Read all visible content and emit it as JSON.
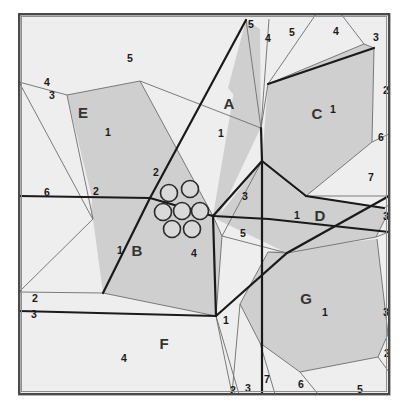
{
  "figure": {
    "name": "power-diagram-partition",
    "background_color": "#ffffff",
    "frame": {
      "x": 18,
      "y": 13,
      "width": 372,
      "height": 382,
      "outer_stroke": "#4a4a4a",
      "inner_stroke": "#8f8f8f"
    },
    "colors": {
      "shaded_cell": "#cfcfcf",
      "light_cell": "#eeeeee",
      "thin_edge": "#6d6d6d",
      "thick_edge": "#1a1a1a",
      "node_fill": "#d9d9d9",
      "node_stroke": "#2a2a2a",
      "label_text": "#1a1a1a"
    }
  },
  "region_labels": [
    {
      "text": "E",
      "x": 83,
      "y": 114
    },
    {
      "text": "A",
      "x": 229,
      "y": 105
    },
    {
      "text": "C",
      "x": 317,
      "y": 115
    },
    {
      "text": "B",
      "x": 137,
      "y": 252
    },
    {
      "text": "D",
      "x": 320,
      "y": 217
    },
    {
      "text": "G",
      "x": 306,
      "y": 300
    },
    {
      "text": "F",
      "x": 164,
      "y": 345
    }
  ],
  "number_labels": [
    {
      "text": "5",
      "x": 130,
      "y": 59
    },
    {
      "text": "4",
      "x": 47,
      "y": 83
    },
    {
      "text": "3",
      "x": 52,
      "y": 96
    },
    {
      "text": "1",
      "x": 108,
      "y": 133
    },
    {
      "text": "5",
      "x": 251,
      "y": 25
    },
    {
      "text": "4",
      "x": 268,
      "y": 39
    },
    {
      "text": "5",
      "x": 292,
      "y": 33
    },
    {
      "text": "4",
      "x": 336,
      "y": 32
    },
    {
      "text": "3",
      "x": 376,
      "y": 38
    },
    {
      "text": "1",
      "x": 333,
      "y": 110
    },
    {
      "text": "2",
      "x": 386,
      "y": 91
    },
    {
      "text": "6",
      "x": 381,
      "y": 138
    },
    {
      "text": "1",
      "x": 221,
      "y": 134
    },
    {
      "text": "2",
      "x": 156,
      "y": 173
    },
    {
      "text": "6",
      "x": 47,
      "y": 193
    },
    {
      "text": "2",
      "x": 96,
      "y": 192
    },
    {
      "text": "3",
      "x": 245,
      "y": 197
    },
    {
      "text": "7",
      "x": 371,
      "y": 178
    },
    {
      "text": "1",
      "x": 297,
      "y": 216
    },
    {
      "text": "3",
      "x": 386,
      "y": 217
    },
    {
      "text": "5",
      "x": 243,
      "y": 234
    },
    {
      "text": "1",
      "x": 120,
      "y": 251
    },
    {
      "text": "4",
      "x": 194,
      "y": 254
    },
    {
      "text": "2",
      "x": 35,
      "y": 299
    },
    {
      "text": "3",
      "x": 34,
      "y": 315
    },
    {
      "text": "1",
      "x": 325,
      "y": 313
    },
    {
      "text": "3",
      "x": 386,
      "y": 313
    },
    {
      "text": "1",
      "x": 226,
      "y": 321
    },
    {
      "text": "2",
      "x": 387,
      "y": 354
    },
    {
      "text": "4",
      "x": 124,
      "y": 359
    },
    {
      "text": "7",
      "x": 267,
      "y": 380
    },
    {
      "text": "6",
      "x": 301,
      "y": 385
    },
    {
      "text": "5",
      "x": 360,
      "y": 390
    },
    {
      "text": "2",
      "x": 233,
      "y": 391
    },
    {
      "text": "3",
      "x": 248,
      "y": 389
    }
  ],
  "nodes": [
    {
      "name": "node-top-left",
      "cx": 169,
      "cy": 193,
      "r": 8.5
    },
    {
      "name": "node-top-right",
      "cx": 190,
      "cy": 189,
      "r": 8.5
    },
    {
      "name": "node-left",
      "cx": 163,
      "cy": 212,
      "r": 8.5
    },
    {
      "name": "node-center",
      "cx": 182,
      "cy": 211,
      "r": 8.5
    },
    {
      "name": "node-right",
      "cx": 200,
      "cy": 211,
      "r": 8.5
    },
    {
      "name": "node-bottom-left",
      "cx": 172,
      "cy": 229,
      "r": 8.5
    },
    {
      "name": "node-bottom-right",
      "cx": 192,
      "cy": 229,
      "r": 8.5
    }
  ],
  "shaded_cells": [
    {
      "name": "cell-E",
      "points": "67,95 140,81 213,216 145,291 91,216 92,198"
    },
    {
      "name": "cell-A",
      "points": "246,20 260,29 261,127 219,216 150,198 150,196 213,216"
    },
    {
      "name": "cell-C",
      "points": "268,84 364,44 374,48 372,142 306,196 262,160"
    },
    {
      "name": "cell-B",
      "points": "148,198 213,216 222,236 216,316 103,293 93,219"
    },
    {
      "name": "cell-D",
      "points": "262,161 303,196 384,208 388,213 376,237 287,253 216,219"
    },
    {
      "name": "cell-G",
      "points": "268,252 377,239 388,334 378,357 300,372 260,343 240,304"
    },
    {
      "name": "cell-A2",
      "points": "246,20 261,128 228,88"
    }
  ],
  "light_cells": [
    {
      "name": "bg-field",
      "points": "19,14 389,14 389,394 19,394"
    }
  ],
  "thin_edges": [
    "M 19,82 L 67,95 L 140,81 L 261,128",
    "M 19,82 L 91,216",
    "M 67,95 L 93,219",
    "M 140,81 L 213,216",
    "M 19,292 L 103,293",
    "M 19,292 L 93,219",
    "M 103,293 L 216,316",
    "M 261,128 L 246,20",
    "M 261,128 L 269,19",
    "M 261,128 L 268,84",
    "M 268,84 L 364,44",
    "M 268,84 L 316,14",
    "M 364,44 L 341,14",
    "M 364,44 L 374,48 L 372,142 L 306,196 L 262,161",
    "M 372,142 L 389,134",
    "M 306,196 L 389,196",
    "M 306,196 L 384,208",
    "M 384,208 L 389,205",
    "M 388,213 L 376,237 L 287,253",
    "M 376,237 L 389,232",
    "M 287,253 L 268,252 L 240,304 L 260,343 L 300,372 L 378,357 L 388,334",
    "M 377,239 L 388,334",
    "M 388,334 L 389,330",
    "M 378,357 L 389,372",
    "M 300,372 L 318,394",
    "M 260,343 L 275,394",
    "M 240,304 L 232,394",
    "M 216,316 L 222,236",
    "M 216,316 L 239,394",
    "M 216,316 L 232,394",
    "M 222,236 L 262,161",
    "M 222,236 L 287,253",
    "M 213,216 L 262,161",
    "M 213,216 L 222,236",
    "M 150,198 L 213,216",
    "M 150,198 L 148,198",
    "M 91,216 L 93,219"
  ],
  "thick_edges": [
    "M 19,196 L 150,198 L 213,216 L 262,161",
    "M 213,216 L 269,219 L 389,232",
    "M 150,198 L 246,20",
    "M 150,198 L 103,293",
    "M 213,216 L 216,316",
    "M 261,128 L 262,161 L 262,394",
    "M 19,311 L 216,316 L 287,253 L 389,196",
    "M 262,161 L 306,196 L 384,208",
    "M 268,84 L 374,48"
  ]
}
